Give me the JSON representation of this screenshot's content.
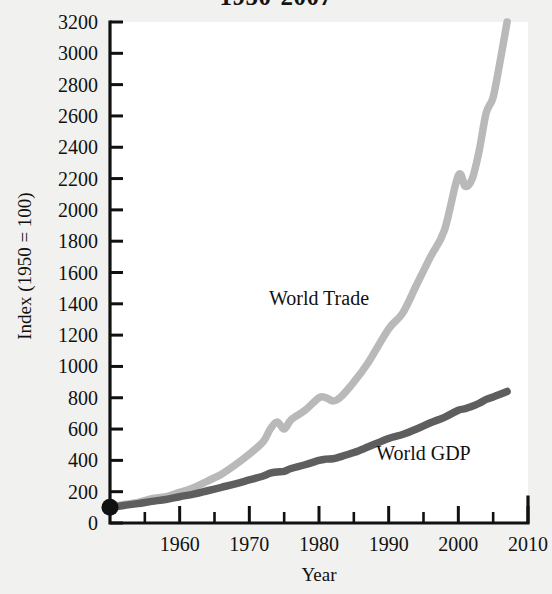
{
  "chart_data": {
    "type": "line",
    "title": "1950-2007",
    "xlabel": "Year",
    "ylabel": "Index (1950 = 100)",
    "xlim": [
      1950,
      2010
    ],
    "ylim": [
      0,
      3200
    ],
    "ytick_step": 200,
    "xtick_step": 10,
    "x_minor_step": 5,
    "grid": false,
    "legend": "inline-annotations",
    "origin_marker": {
      "label": "origin-dot",
      "x": 1950,
      "y": 100,
      "color": "#111111"
    },
    "yticks": [
      0,
      200,
      400,
      600,
      800,
      1000,
      1200,
      1400,
      1600,
      1800,
      2000,
      2200,
      2400,
      2600,
      2800,
      3000,
      3200
    ],
    "ytick_labels": [
      "0",
      "200",
      "400",
      "600",
      "800",
      "1000",
      "1200",
      "1400",
      "1600",
      "1800",
      "2000",
      "2200",
      "2400",
      "2600",
      "2800",
      "3000",
      "3200"
    ],
    "xticks": [
      1960,
      1970,
      1980,
      1990,
      2000,
      2010
    ],
    "xtick_labels": [
      "1960",
      "1970",
      "1980",
      "1990",
      "2000",
      "2010"
    ],
    "x": [
      1950,
      1952,
      1954,
      1956,
      1958,
      1960,
      1962,
      1964,
      1966,
      1968,
      1970,
      1972,
      1973,
      1974,
      1975,
      1976,
      1978,
      1980,
      1981,
      1982,
      1983,
      1985,
      1987,
      1990,
      1992,
      1994,
      1996,
      1998,
      2000,
      2001,
      2002,
      2003,
      2004,
      2005,
      2006,
      2007
    ],
    "series": [
      {
        "name": "World Trade",
        "color": "#b9b9b9",
        "label_x": 1980,
        "label_y": 1390,
        "values": [
          100,
          118,
          132,
          155,
          168,
          196,
          225,
          268,
          312,
          372,
          440,
          520,
          600,
          645,
          600,
          660,
          720,
          800,
          800,
          780,
          800,
          900,
          1020,
          1240,
          1340,
          1520,
          1700,
          1870,
          2220,
          2150,
          2200,
          2380,
          2620,
          2720,
          2950,
          3200
        ]
      },
      {
        "name": "World GDP",
        "color": "#5e5e5e",
        "label_x": 1995,
        "label_y": 400,
        "values": [
          100,
          112,
          124,
          138,
          150,
          168,
          184,
          206,
          228,
          250,
          275,
          300,
          318,
          326,
          330,
          348,
          372,
          400,
          408,
          410,
          422,
          450,
          485,
          540,
          565,
          600,
          640,
          675,
          720,
          730,
          745,
          765,
          790,
          805,
          822,
          840
        ]
      }
    ]
  }
}
